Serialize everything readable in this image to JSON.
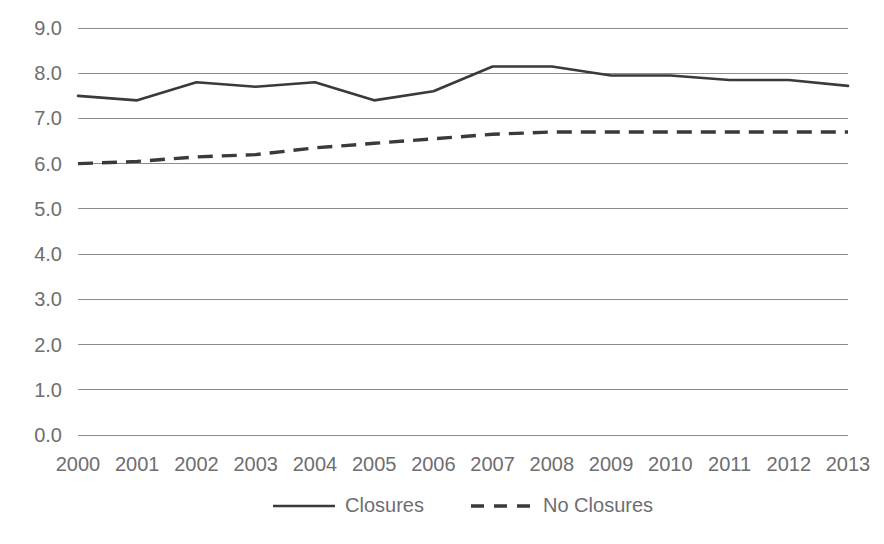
{
  "chart_data": {
    "type": "line",
    "title": "",
    "subtitle": "",
    "xlabel": "",
    "ylabel": "",
    "categories": [
      "2000",
      "2001",
      "2002",
      "2003",
      "2004",
      "2005",
      "2006",
      "2007",
      "2008",
      "2009",
      "2010",
      "2011",
      "2012",
      "2013"
    ],
    "y_ticks": [
      "0.0",
      "1.0",
      "2.0",
      "3.0",
      "4.0",
      "5.0",
      "6.0",
      "7.0",
      "8.0",
      "9.0"
    ],
    "ylim": [
      0.0,
      9.0
    ],
    "grid": "horizontal",
    "legend_position": "bottom",
    "series": [
      {
        "name": "Closures",
        "style": "solid",
        "color": "#3a3a3c",
        "values": [
          7.5,
          7.4,
          7.8,
          7.7,
          7.8,
          7.4,
          7.6,
          8.15,
          8.15,
          7.95,
          7.95,
          7.85,
          7.85,
          7.72
        ]
      },
      {
        "name": "No Closures",
        "style": "dashed",
        "color": "#3a3a3c",
        "values": [
          6.0,
          6.05,
          6.15,
          6.2,
          6.35,
          6.45,
          6.55,
          6.65,
          6.7,
          6.7,
          6.7,
          6.7,
          6.7,
          6.7
        ]
      }
    ]
  },
  "legend": {
    "items": [
      {
        "label": "Closures"
      },
      {
        "label": "No Closures"
      }
    ]
  }
}
